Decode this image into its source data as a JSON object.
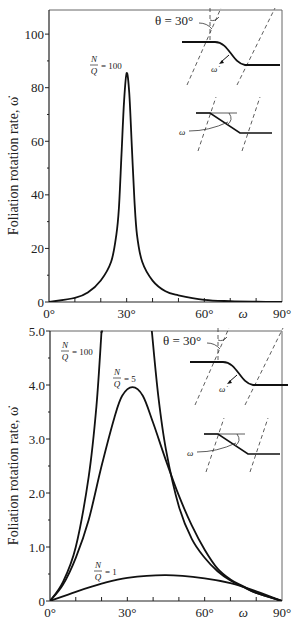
{
  "chart_data": [
    {
      "type": "line",
      "title": "",
      "xlabel": "ω",
      "ylabel": "Foliation rotation rate, ω̇",
      "xlim": [
        0,
        90
      ],
      "ylim": [
        0,
        109
      ],
      "x_ticks": [
        "0°",
        "30°",
        "60°",
        "90°"
      ],
      "y_ticks": [
        "0",
        "20",
        "40",
        "60",
        "80",
        "100"
      ],
      "grid": false,
      "series": [
        {
          "name": "N/Q = 100",
          "x": [
            0,
            10,
            15,
            20,
            24,
            26,
            27,
            28,
            29,
            30,
            31,
            32,
            33,
            34,
            36,
            40,
            45,
            50,
            60,
            70,
            80,
            90
          ],
          "values": [
            0,
            1.5,
            3.5,
            8,
            15,
            25,
            35,
            55,
            75,
            85.5,
            78,
            58,
            38,
            25,
            15,
            8,
            4,
            2.5,
            0.8,
            0.3,
            0.1,
            0
          ]
        }
      ],
      "annotations": [
        "N/Q = 100",
        "θ = 30°",
        "ω̇",
        "ω"
      ]
    },
    {
      "type": "line",
      "title": "",
      "xlabel": "ω",
      "ylabel": "Foliation rotation rate, ω̇",
      "xlim": [
        0,
        90
      ],
      "ylim": [
        0,
        5.0
      ],
      "x_ticks": [
        "0°",
        "30°",
        "60°",
        "90°"
      ],
      "y_ticks": [
        "0",
        "1.0",
        "2.0",
        "3.0",
        "4.0",
        "5.0"
      ],
      "grid": false,
      "series": [
        {
          "name": "N/Q = 100",
          "x": [
            0,
            5,
            10,
            15,
            18,
            20,
            39.5,
            42,
            45,
            50,
            55,
            60,
            65,
            70,
            75,
            80,
            90
          ],
          "values": [
            0,
            0.35,
            1.0,
            2.3,
            3.6,
            5.0,
            5.0,
            3.8,
            2.8,
            1.75,
            1.15,
            0.8,
            0.55,
            0.38,
            0.26,
            0.15,
            0
          ]
        },
        {
          "name": "N/Q = 5",
          "x": [
            0,
            5,
            10,
            15,
            20,
            25,
            28,
            32,
            36,
            40,
            45,
            50,
            55,
            60,
            65,
            70,
            75,
            80,
            90
          ],
          "values": [
            0,
            0.3,
            0.8,
            1.5,
            2.5,
            3.4,
            3.8,
            3.96,
            3.8,
            3.3,
            2.6,
            1.95,
            1.4,
            0.95,
            0.6,
            0.4,
            0.27,
            0.15,
            0
          ]
        },
        {
          "name": "N/Q = 1",
          "x": [
            0,
            10,
            20,
            30,
            45,
            60,
            70,
            80,
            90
          ],
          "values": [
            0,
            0.17,
            0.32,
            0.43,
            0.48,
            0.42,
            0.33,
            0.18,
            0
          ]
        }
      ],
      "annotations": [
        "N/Q = 100",
        "N/Q = 5",
        "N/Q = 1",
        "θ = 30°",
        "ω̇",
        "ω"
      ]
    }
  ],
  "labels": {
    "ylabel": "Foliation rotation rate, ω̇",
    "xvar": "ω",
    "theta": "θ = 30°",
    "omega_dot": "ω̇",
    "omega": "ω",
    "n": "N",
    "q": "Q",
    "eq100": "= 100",
    "eq5": "= 5",
    "eq1": "= 1"
  }
}
